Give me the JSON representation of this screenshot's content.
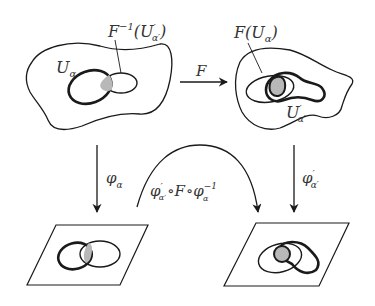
{
  "labels": {
    "finv_main": "F",
    "finv_sup": "−1",
    "finv_paren_open": "(",
    "finv_U": "U",
    "finv_prime": "′",
    "finv_sub": "α′",
    "finv_paren_close": ")",
    "u_alpha_main": "U",
    "u_alpha_sub": "α",
    "f_arrow": "F",
    "fu_main": "F",
    "fu_open": "(",
    "fu_U": "U",
    "fu_sub": "α",
    "fu_close": ")",
    "uprime_main": "U",
    "uprime_prime": "′",
    "uprime_sub": "α′",
    "phi_left_main": "φ",
    "phi_left_sub": "α",
    "phi_right_main": "φ",
    "phi_right_prime": "′",
    "phi_right_sub": "α′",
    "comp_phi1": "φ",
    "comp_phi1_prime": "′",
    "comp_phi1_sub": "α′",
    "comp_circ1": "∘",
    "comp_F": "F",
    "comp_circ2": "∘",
    "comp_phi2": "φ",
    "comp_phi2_sub": "α",
    "comp_phi2_sup": "−1"
  },
  "colors": {
    "stroke": "#1a1a1a",
    "shade": "#b8b8b8",
    "text": "#333333"
  }
}
